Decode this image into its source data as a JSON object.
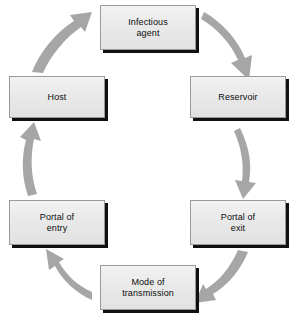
{
  "diagram": {
    "type": "cycle",
    "direction": "clockwise",
    "background_color": "#ffffff",
    "node_fill_color": "#e9e9e9",
    "node_border_color": "#9a9a9a",
    "node_shadow_color": "#101010",
    "arrow_color": "#a6a6a6",
    "text_color": "#0d0d0d",
    "nodes": [
      {
        "id": "infectious-agent",
        "label": "Infectious\nagent",
        "position": "top"
      },
      {
        "id": "reservoir",
        "label": "Reservoir",
        "position": "upper-right"
      },
      {
        "id": "portal-of-exit",
        "label": "Portal of\nexit",
        "position": "lower-right"
      },
      {
        "id": "mode-of-transmission",
        "label": "Mode of\ntransmission",
        "position": "bottom"
      },
      {
        "id": "portal-of-entry",
        "label": "Portal of\nentry",
        "position": "lower-left"
      },
      {
        "id": "host",
        "label": "Host",
        "position": "upper-left"
      }
    ],
    "arrows": [
      {
        "id": "arrow-agent-to-reservoir",
        "from": "infectious-agent",
        "to": "reservoir"
      },
      {
        "id": "arrow-reservoir-to-exit",
        "from": "reservoir",
        "to": "portal-of-exit"
      },
      {
        "id": "arrow-exit-to-transmission",
        "from": "portal-of-exit",
        "to": "mode-of-transmission"
      },
      {
        "id": "arrow-transmission-to-entry",
        "from": "mode-of-transmission",
        "to": "portal-of-entry"
      },
      {
        "id": "arrow-entry-to-host",
        "from": "portal-of-entry",
        "to": "host"
      },
      {
        "id": "arrow-host-to-agent",
        "from": "host",
        "to": "infectious-agent"
      }
    ]
  }
}
